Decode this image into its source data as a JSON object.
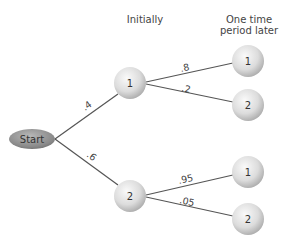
{
  "headers": {
    "initially": "Initially",
    "later_line1": "One time",
    "later_line2": "period later"
  },
  "start": {
    "label": "Start"
  },
  "initial_nodes": [
    {
      "label": "1",
      "prob_from_start": ".4"
    },
    {
      "label": "2",
      "prob_from_start": ".6"
    }
  ],
  "later_nodes": [
    {
      "label": "1",
      "prob": ".8"
    },
    {
      "label": "2",
      "prob": ".2"
    },
    {
      "label": "1",
      "prob": ".95"
    },
    {
      "label": "2",
      "prob": ".05"
    }
  ],
  "colors": {
    "line": "#555555",
    "node_fill_light": "#f4f4f4",
    "node_fill_dark": "#bdbdbd",
    "start_fill": "#8a8a8a"
  }
}
